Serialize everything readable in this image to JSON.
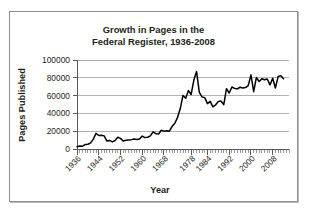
{
  "figure": {
    "border_color": "#8a8d92",
    "background": "#ffffff"
  },
  "chart_data": {
    "type": "line",
    "title": "Growth in Pages in the\nFederal Register, 1936-2008",
    "title_line1": "Growth in Pages in the",
    "title_line2": "Federal Register, 1936-2008",
    "xlabel": "Year",
    "ylabel": "Pages Published",
    "xlim": [
      1936,
      2014
    ],
    "ylim": [
      0,
      100000
    ],
    "grid": true,
    "grid_axis": "y",
    "legend": false,
    "line_color": "#000000",
    "ytick_labels": [
      "0",
      "20000",
      "40000",
      "60000",
      "80000",
      "100000"
    ],
    "ytick_values": [
      0,
      20000,
      40000,
      60000,
      80000,
      100000
    ],
    "xtick_labels": [
      "1936",
      "1944",
      "1952",
      "1960",
      "1968",
      "1978",
      "1984",
      "1992",
      "2000",
      "2008"
    ],
    "xtick_values": [
      1936,
      1944,
      1952,
      1960,
      1968,
      1978,
      1984,
      1992,
      2000,
      2008
    ],
    "x_minor_step": 1,
    "series": [
      {
        "name": "Pages Published",
        "x": [
          1936,
          1937,
          1938,
          1939,
          1940,
          1941,
          1942,
          1943,
          1944,
          1945,
          1946,
          1947,
          1948,
          1949,
          1950,
          1951,
          1952,
          1953,
          1954,
          1955,
          1956,
          1957,
          1958,
          1959,
          1960,
          1961,
          1962,
          1963,
          1964,
          1965,
          1966,
          1967,
          1968,
          1969,
          1970,
          1971,
          1972,
          1973,
          1974,
          1975,
          1976,
          1977,
          1978,
          1979,
          1980,
          1981,
          1982,
          1983,
          1984,
          1985,
          1986,
          1987,
          1988,
          1989,
          1990,
          1991,
          1992,
          1993,
          1994,
          1995,
          1996,
          1997,
          1998,
          1999,
          2000,
          2001,
          2002,
          2003,
          2004,
          2005,
          2006,
          2007,
          2008,
          2009,
          2010,
          2011,
          2012
        ],
        "values": [
          2620,
          3450,
          3195,
          5007,
          5307,
          6877,
          11134,
          17553,
          15194,
          15508,
          14736,
          8902,
          9608,
          7952,
          9562,
          13175,
          11896,
          8912,
          9910,
          10196,
          10528,
          11156,
          10579,
          11116,
          14479,
          12792,
          13226,
          14842,
          19304,
          17206,
          16850,
          21087,
          20072,
          20464,
          20036,
          25442,
          28924,
          35586,
          45422,
          60221,
          57072,
          65603,
          61261,
          77498,
          87012,
          63554,
          58494,
          57704,
          50997,
          53480,
          47418,
          49654,
          53376,
          53821,
          49795,
          67716,
          62928,
          69684,
          68108,
          67518,
          69368,
          68530,
          68981,
          71161,
          83293,
          64438,
          80332,
          75798,
          78851,
          77752,
          78724,
          72090,
          79435,
          68598,
          81405,
          82415,
          78961
        ],
        "_approx_plot_points": [
          {
            "year": 1936,
            "pages": 3000
          },
          {
            "year": 1940,
            "pages": 5300
          },
          {
            "year": 1943,
            "pages": 17500
          },
          {
            "year": 1946,
            "pages": 14700
          },
          {
            "year": 1948,
            "pages": 9600
          },
          {
            "year": 1951,
            "pages": 13200
          },
          {
            "year": 1954,
            "pages": 9900
          },
          {
            "year": 1960,
            "pages": 14500
          },
          {
            "year": 1964,
            "pages": 19300
          },
          {
            "year": 1968,
            "pages": 20100
          },
          {
            "year": 1971,
            "pages": 25400
          },
          {
            "year": 1975,
            "pages": 60200
          },
          {
            "year": 1977,
            "pages": 65600
          },
          {
            "year": 1980,
            "pages": 87000
          },
          {
            "year": 1984,
            "pages": 51000
          },
          {
            "year": 1992,
            "pages": 62900
          },
          {
            "year": 2000,
            "pages": 83300
          },
          {
            "year": 2008,
            "pages": 79400
          },
          {
            "year": 2012,
            "pages": 79000
          }
        ]
      }
    ]
  }
}
